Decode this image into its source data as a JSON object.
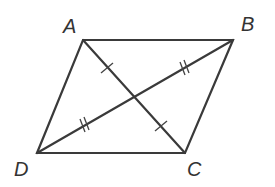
{
  "diagram": {
    "type": "parallelogram with diagonals",
    "vertices": {
      "A": {
        "label": "A",
        "x": 83,
        "y": 40
      },
      "B": {
        "label": "B",
        "x": 233,
        "y": 40
      },
      "C": {
        "label": "C",
        "x": 185,
        "y": 153
      },
      "D": {
        "label": "D",
        "x": 37,
        "y": 153
      }
    },
    "labels": {
      "A": "A",
      "B": "B",
      "C": "C",
      "D": "D"
    },
    "sides": [
      "AB",
      "BC",
      "CD",
      "DA"
    ],
    "diagonals": [
      "AC",
      "BD"
    ],
    "tick_marks": {
      "AC_halves": "single tick",
      "BD_halves": "double tick"
    },
    "colors": {
      "stroke": "#3a3a3a",
      "background": "#ffffff"
    }
  }
}
